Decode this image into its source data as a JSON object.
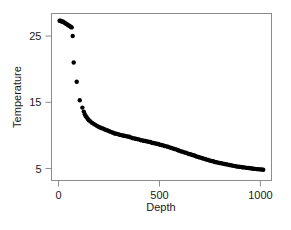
{
  "chart_data": {
    "type": "scatter",
    "title": "",
    "xlabel": "Depth",
    "ylabel": "Temperature",
    "xlim": [
      -35,
      1055
    ],
    "ylim": [
      3.2,
      28.4
    ],
    "xticks": [
      0,
      500,
      1000
    ],
    "xtick_labels": [
      "0",
      "500",
      "1000"
    ],
    "yticks": [
      5,
      15,
      25
    ],
    "ytick_labels": [
      "5",
      "15",
      "25"
    ],
    "grid": false,
    "legend": null,
    "marker": "filled-circle",
    "marker_color": "#000000",
    "frame_color": "#8c8c8c",
    "background_color": "#ffffff",
    "x": [
      5,
      10,
      15,
      20,
      25,
      30,
      35,
      40,
      45,
      50,
      55,
      60,
      65,
      70,
      75,
      90,
      105,
      118,
      125,
      130,
      135,
      140,
      145,
      150,
      158,
      166,
      174,
      182,
      190,
      198,
      206,
      214,
      222,
      230,
      238,
      246,
      254,
      262,
      270,
      278,
      286,
      294,
      302,
      310,
      318,
      326,
      334,
      342,
      350,
      358,
      366,
      374,
      382,
      390,
      398,
      406,
      414,
      422,
      430,
      438,
      446,
      454,
      462,
      470,
      478,
      486,
      494,
      502,
      510,
      518,
      526,
      534,
      542,
      550,
      558,
      566,
      574,
      582,
      590,
      598,
      606,
      614,
      622,
      630,
      638,
      646,
      654,
      662,
      670,
      678,
      686,
      694,
      702,
      710,
      718,
      726,
      734,
      742,
      750,
      758,
      766,
      774,
      782,
      790,
      798,
      806,
      814,
      822,
      830,
      838,
      846,
      854,
      862,
      870,
      878,
      886,
      894,
      902,
      910,
      918,
      926,
      934,
      942,
      950,
      958,
      966,
      974,
      982,
      990,
      998,
      1006,
      1014
    ],
    "y": [
      27.3,
      27.3,
      27.2,
      27.2,
      27.1,
      27.0,
      26.9,
      26.8,
      26.7,
      26.6,
      26.5,
      26.4,
      26.3,
      25.0,
      21.0,
      18.1,
      15.3,
      14.2,
      13.6,
      13.2,
      12.9,
      12.7,
      12.5,
      12.3,
      12.1,
      11.9,
      11.75,
      11.6,
      11.45,
      11.3,
      11.2,
      11.1,
      11.0,
      10.9,
      10.8,
      10.7,
      10.6,
      10.5,
      10.4,
      10.3,
      10.25,
      10.2,
      10.1,
      10.05,
      10.0,
      9.95,
      9.9,
      9.85,
      9.8,
      9.7,
      9.6,
      9.55,
      9.5,
      9.45,
      9.4,
      9.3,
      9.25,
      9.2,
      9.15,
      9.1,
      9.05,
      9.0,
      8.9,
      8.85,
      8.8,
      8.75,
      8.7,
      8.6,
      8.55,
      8.5,
      8.4,
      8.35,
      8.3,
      8.2,
      8.1,
      8.05,
      7.95,
      7.9,
      7.8,
      7.7,
      7.6,
      7.55,
      7.45,
      7.4,
      7.3,
      7.2,
      7.15,
      7.05,
      7.0,
      6.9,
      6.8,
      6.75,
      6.65,
      6.6,
      6.5,
      6.45,
      6.35,
      6.3,
      6.2,
      6.15,
      6.1,
      6.0,
      5.95,
      5.9,
      5.85,
      5.8,
      5.75,
      5.7,
      5.65,
      5.6,
      5.55,
      5.5,
      5.45,
      5.4,
      5.35,
      5.3,
      5.28,
      5.25,
      5.2,
      5.18,
      5.15,
      5.1,
      5.08,
      5.05,
      5.0,
      4.98,
      4.95,
      4.92,
      4.9,
      4.88,
      4.85,
      4.82,
      4.8,
      4.78
    ]
  },
  "axes": {
    "x_title": "Depth",
    "y_title": "Temperature"
  },
  "footer": {
    "clipped_text": ""
  }
}
